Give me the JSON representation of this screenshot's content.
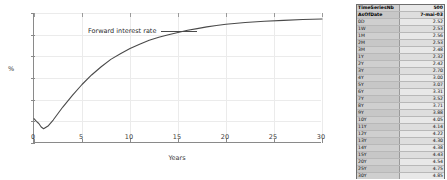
{
  "chart_data": {
    "type": "line",
    "title": "",
    "xlabel": "Years",
    "ylabel": "%",
    "xlim": [
      0,
      30
    ],
    "ylim": [
      2,
      5
    ],
    "grid": true,
    "legend_position": "top-left",
    "series": [
      {
        "name": "Forward interest rate",
        "color": "#4a4a4a",
        "x": [
          0,
          0.25,
          0.5,
          0.75,
          1,
          1.5,
          2,
          2.5,
          3,
          4,
          5,
          6,
          7,
          8,
          9,
          10,
          11,
          12,
          13,
          14,
          15,
          16,
          17,
          18,
          19,
          20,
          22,
          24,
          26,
          28,
          30
        ],
        "y": [
          2.56,
          2.5,
          2.45,
          2.37,
          2.33,
          2.4,
          2.53,
          2.68,
          2.83,
          3.1,
          3.35,
          3.57,
          3.76,
          3.93,
          4.06,
          4.18,
          4.28,
          4.37,
          4.44,
          4.5,
          4.55,
          4.6,
          4.64,
          4.68,
          4.71,
          4.74,
          4.78,
          4.81,
          4.83,
          4.85,
          4.86
        ]
      }
    ],
    "x_ticks": [
      {
        "value": 0,
        "label": "0"
      },
      {
        "value": 5,
        "label": "5"
      },
      {
        "value": 10,
        "label": "10"
      },
      {
        "value": 15,
        "label": "15"
      },
      {
        "value": 20,
        "label": "20"
      },
      {
        "value": 25,
        "label": "25"
      },
      {
        "value": 30,
        "label": "30"
      }
    ],
    "y_ticks": [
      {
        "value": 2,
        "label": "2"
      },
      {
        "value": 2.5,
        "label": "2.5"
      },
      {
        "value": 3,
        "label": "3"
      },
      {
        "value": 3.5,
        "label": "3.5"
      },
      {
        "value": 4,
        "label": "4"
      },
      {
        "value": 4.5,
        "label": "4.5"
      },
      {
        "value": 5,
        "label": "5"
      }
    ]
  },
  "legend": {
    "entry_label": "Forward interest rate"
  },
  "table": {
    "header_rows": [
      {
        "label": "TimeSeriesNb",
        "value": "500"
      },
      {
        "label": "AsOfDate",
        "value": "7-mai-03"
      }
    ],
    "rows": [
      {
        "label": "0D",
        "value": "2.52"
      },
      {
        "label": "1W",
        "value": "2.53"
      },
      {
        "label": "1M",
        "value": "2.56"
      },
      {
        "label": "2M",
        "value": "2.53"
      },
      {
        "label": "3M",
        "value": "2.48"
      },
      {
        "label": "1Y",
        "value": "2.32"
      },
      {
        "label": "2Y",
        "value": "2.42"
      },
      {
        "label": "3Y",
        "value": "2.70"
      },
      {
        "label": "4Y",
        "value": "3.00"
      },
      {
        "label": "5Y",
        "value": "3.07"
      },
      {
        "label": "6Y",
        "value": "3.31"
      },
      {
        "label": "7Y",
        "value": "3.52"
      },
      {
        "label": "8Y",
        "value": "3.71"
      },
      {
        "label": "9Y",
        "value": "3.88"
      },
      {
        "label": "10Y",
        "value": "4.05"
      },
      {
        "label": "11Y",
        "value": "4.14"
      },
      {
        "label": "12Y",
        "value": "4.22"
      },
      {
        "label": "13Y",
        "value": "4.30"
      },
      {
        "label": "14Y",
        "value": "4.38"
      },
      {
        "label": "15Y",
        "value": "4.43"
      },
      {
        "label": "20Y",
        "value": "4.54"
      },
      {
        "label": "25Y",
        "value": "4.75"
      },
      {
        "label": "30Y",
        "value": "4.85"
      },
      {
        "label": "40Y",
        "value": "4.88"
      }
    ]
  }
}
